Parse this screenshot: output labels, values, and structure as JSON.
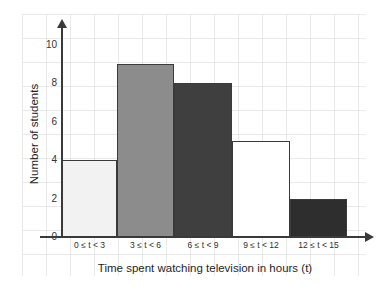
{
  "chart_data": {
    "type": "bar",
    "title": "",
    "subtitle": "",
    "xlabel": "Time spent watching television in hours (t)",
    "ylabel": "Number of students",
    "categories": [
      "0 ≤ t < 3",
      "3 ≤ t < 6",
      "6 ≤ t < 9",
      "9 ≤ t < 12",
      "12 ≤ t < 15"
    ],
    "values": [
      4,
      9,
      8,
      5,
      2
    ],
    "bar_colors": [
      "#f2f2f2",
      "#8c8c8c",
      "#3f3f3f",
      "#ffffff",
      "#2e2e2e"
    ],
    "bar_border_color": "#3a3a3a",
    "ylim": [
      0,
      11
    ],
    "ytick_labels": [
      "0",
      "2",
      "4",
      "6",
      "8",
      "10"
    ],
    "ytick_values": [
      0,
      2,
      4,
      6,
      8,
      10
    ],
    "grid": true,
    "grid_color": "#e9e9ea",
    "legend": "none",
    "axis_color": "#3a3a3a",
    "background": "#ffffff"
  }
}
